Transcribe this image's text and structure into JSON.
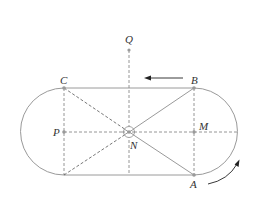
{
  "diagram": {
    "type": "track-geometry",
    "points": {
      "Q": {
        "label": "Q",
        "x": 129,
        "y": 50
      },
      "C": {
        "label": "C",
        "x": 64,
        "y": 88
      },
      "B": {
        "label": "B",
        "x": 194,
        "y": 88
      },
      "P": {
        "label": "P",
        "x": 64,
        "y": 132
      },
      "N": {
        "label": "N",
        "x": 129,
        "y": 132
      },
      "M": {
        "label": "M",
        "x": 194,
        "y": 132
      },
      "A": {
        "label": "A",
        "x": 194,
        "y": 175
      }
    },
    "arrows": {
      "straight": {
        "direction": "left",
        "meaning": "motion along top straight from B toward C"
      },
      "curved": {
        "direction": "counterclockwise-up",
        "meaning": "motion along right arc from A upward"
      }
    },
    "colors": {
      "lines": "#9a9a9a",
      "dashed": "#8a8a8a",
      "arrows": "#222222",
      "labels": "#333333"
    }
  }
}
